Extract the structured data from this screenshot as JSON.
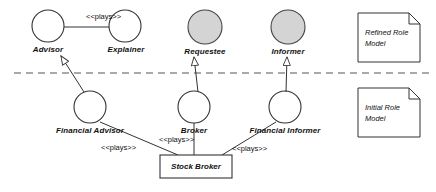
{
  "diagram": {
    "type": "uml-role-model",
    "colors": {
      "stroke": "#333333",
      "shaded_fill": "#d4d4d4",
      "white_fill": "#ffffff",
      "text": "#111111",
      "dashed_divider": "#555555"
    },
    "divider": {
      "name": "refinement-divider",
      "style": "dashed",
      "y": 73
    },
    "upper_roles": [
      {
        "id": "advisor",
        "label": "Advisor",
        "cx": 48,
        "cy": 26,
        "r": 16,
        "shaded": false
      },
      {
        "id": "explainer",
        "label": "Explainer",
        "cx": 125,
        "cy": 26,
        "r": 16,
        "shaded": false
      },
      {
        "id": "requestee",
        "label": "Requestee",
        "cx": 205,
        "cy": 27,
        "r": 17,
        "shaded": true
      },
      {
        "id": "informer",
        "label": "Informer",
        "cx": 288,
        "cy": 27,
        "r": 17,
        "shaded": true
      }
    ],
    "lower_roles": [
      {
        "id": "financial-advisor",
        "label": "Financial Advisor",
        "cx": 90,
        "cy": 107,
        "r": 16,
        "shaded": false
      },
      {
        "id": "broker",
        "label": "Broker",
        "cx": 194,
        "cy": 107,
        "r": 16,
        "shaded": false
      },
      {
        "id": "financial-informer",
        "label": "Financial Informer",
        "cx": 285,
        "cy": 107,
        "r": 16,
        "shaded": false
      }
    ],
    "class_box": {
      "id": "stock-broker",
      "label": "Stock Broker",
      "x": 160,
      "y": 155,
      "width": 72,
      "height": 23
    },
    "associations": [
      {
        "id": "advisor-explainer",
        "label": "<<plays>>",
        "from": "advisor",
        "to": "explainer"
      }
    ],
    "stereotype_labels": [
      {
        "id": "plays-top",
        "text": "<<plays>>",
        "x": 86,
        "y": 12
      },
      {
        "id": "plays-left",
        "text": "<<plays>>",
        "x": 127,
        "y": 144
      },
      {
        "id": "plays-mid",
        "text": "<<plays>>",
        "x": 185,
        "y": 137
      },
      {
        "id": "plays-right",
        "text": "<<plays>>",
        "x": 258,
        "y": 144
      }
    ],
    "notes": [
      {
        "id": "refined-role-model",
        "line1": "Refined Role",
        "line2": "Model",
        "x": 358,
        "y": 13,
        "width": 62,
        "height": 49
      },
      {
        "id": "initial-role-model",
        "line1": "Initial Role",
        "line2": "Model",
        "x": 358,
        "y": 88,
        "width": 62,
        "height": 49
      }
    ],
    "refinement_arrows": [
      {
        "id": "financial-advisor-to-advisor",
        "from": "financial-advisor",
        "to": "advisor"
      },
      {
        "id": "broker-to-requestee",
        "from": "broker",
        "to": "requestee"
      },
      {
        "id": "financial-informer-to-informer",
        "from": "financial-informer",
        "to": "informer"
      }
    ]
  }
}
